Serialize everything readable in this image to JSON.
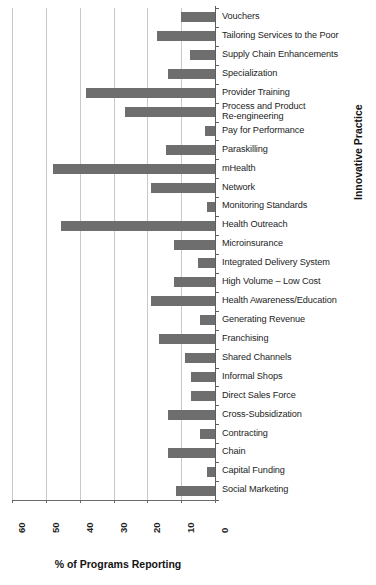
{
  "chart_data": {
    "type": "bar",
    "orientation": "horizontal",
    "title": "",
    "xlabel": "% of Programs Reporting",
    "ylabel": "Innovative Practice",
    "xlim": [
      60,
      0
    ],
    "x_axis_reversed": true,
    "xticks": [
      "60",
      "50",
      "40",
      "30",
      "20",
      "10",
      "0"
    ],
    "xtick_values": [
      60,
      50,
      40,
      30,
      20,
      10,
      0
    ],
    "grid": "vertical",
    "legend": "none",
    "bar_color": "#6e6e6e",
    "categories": [
      "Vouchers",
      "Tailoring Services to the Poor",
      "Supply Chain Enhancements",
      "Specialization",
      "Provider Training",
      "Process and Product\nRe-engineering",
      "Pay for Performance",
      "Paraskilling",
      "mHealth",
      "Network",
      "Monitoring Standards",
      "Health Outreach",
      "Microinsurance",
      "Integrated Delivery System",
      "High Volume – Low Cost",
      "Health Awareness/Education",
      "Generating Revenue",
      "Franchising",
      "Shared Channels",
      "Informal Shops",
      "Direct Sales Force",
      "Cross-Subsidization",
      "Contracting",
      "Chain",
      "Capital Funding",
      "Social Marketing"
    ],
    "values": [
      10,
      17,
      7.5,
      14,
      38,
      26.5,
      3,
      14.5,
      48,
      19,
      2.5,
      45.5,
      12,
      5,
      12,
      19,
      4.5,
      16.5,
      9,
      7,
      7,
      14,
      4.5,
      14,
      2.5,
      11.5
    ]
  }
}
